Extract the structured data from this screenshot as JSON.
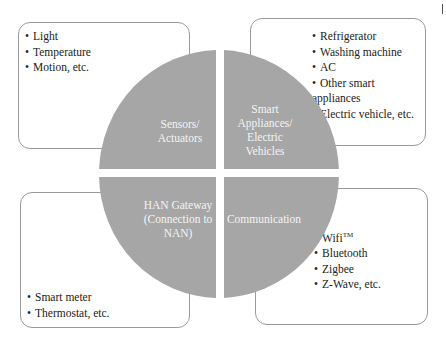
{
  "diagram": {
    "colors": {
      "quadrant_fill": "#a6a6a6",
      "box_border": "#9a9a9a",
      "label_text": "#f4f4f4",
      "body_text": "#222222"
    },
    "quadrants": [
      {
        "id": "top-left",
        "label_lines": [
          "Sensors/",
          "Actuators"
        ]
      },
      {
        "id": "top-right",
        "label_lines": [
          "Smart",
          "Appliances/",
          "Electric",
          "Vehicles"
        ]
      },
      {
        "id": "bottom-left",
        "label_lines": [
          "HAN Gateway",
          "(Connection to",
          "NAN)"
        ]
      },
      {
        "id": "bottom-right",
        "label_lines": [
          "Communication"
        ]
      }
    ],
    "boxes": {
      "top_left": {
        "items": [
          "Light",
          "Temperature",
          "Motion, etc."
        ]
      },
      "top_right": {
        "items": [
          "Refrigerator",
          "Washing machine",
          "AC",
          "Other smart appliances",
          "Electric vehicle, etc."
        ]
      },
      "bottom_left": {
        "items": [
          "Smart meter",
          "Thermostat, etc."
        ]
      },
      "bottom_right": {
        "items": [
          "Wifi",
          "Bluetooth",
          "Zigbee",
          "Z-Wave, etc."
        ],
        "wifi_superscript": "TM"
      }
    }
  }
}
